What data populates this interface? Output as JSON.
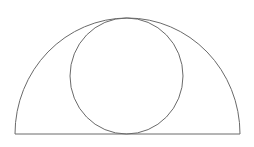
{
  "diagram": {
    "stroke_color": "#6a6a6a",
    "background": "#ffffff",
    "semicircle": {
      "cx": 127.5,
      "cy": 134,
      "rx": 112.5,
      "ry": 116,
      "left_x": 15,
      "right_x": 240,
      "baseline_y": 134
    },
    "inner_circle": {
      "cx": 126.5,
      "cy": 76,
      "rx": 56.5,
      "ry": 58
    }
  }
}
